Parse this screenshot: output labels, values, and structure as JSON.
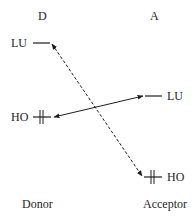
{
  "diagram": {
    "columns": {
      "donor_header": "D",
      "acceptor_header": "A",
      "donor_caption": "Donor",
      "acceptor_caption": "Acceptor"
    },
    "levels": {
      "donor_lu": {
        "label": "LU",
        "occupied": false
      },
      "donor_ho": {
        "label": "HO",
        "occupied": true
      },
      "acceptor_lu": {
        "label": "LU",
        "occupied": false
      },
      "acceptor_ho": {
        "label": "HO",
        "occupied": true
      }
    },
    "interactions": [
      {
        "from": "donor_ho",
        "to": "acceptor_lu",
        "style": "solid",
        "arrowheads": "both"
      },
      {
        "from": "acceptor_ho",
        "to": "donor_lu",
        "style": "dashed",
        "arrowheads": "both"
      }
    ],
    "colors": {
      "ink": "#1e1e1e",
      "background": "#ffffff"
    }
  }
}
